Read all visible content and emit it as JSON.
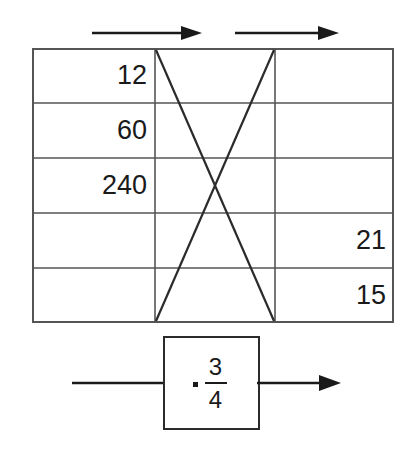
{
  "diagram": {
    "line_color": "#555555",
    "stroke_color": "#2b2b2b",
    "text_color": "#1a1a1a",
    "background": "#ffffff"
  },
  "top_arrows": [
    {
      "name": "arrow-column-a-to-b",
      "label": ""
    },
    {
      "name": "arrow-column-b-to-c",
      "label": ""
    }
  ],
  "table": {
    "columns": [
      "",
      "",
      ""
    ],
    "rows": [
      {
        "a": "12",
        "b": "",
        "c": ""
      },
      {
        "a": "60",
        "b": "",
        "c": ""
      },
      {
        "a": "240",
        "b": "",
        "c": ""
      },
      {
        "a": "",
        "b": "",
        "c": "21"
      },
      {
        "a": "",
        "b": "",
        "c": "15"
      }
    ]
  },
  "cross_lines": {
    "name": "x-cross-overlay",
    "description": "two diagonals forming an X across the middle column"
  },
  "operator_box": {
    "operator": "·",
    "fraction": {
      "numerator": "3",
      "denominator": "4"
    },
    "input_wire_label": "",
    "output_wire_label": ""
  }
}
